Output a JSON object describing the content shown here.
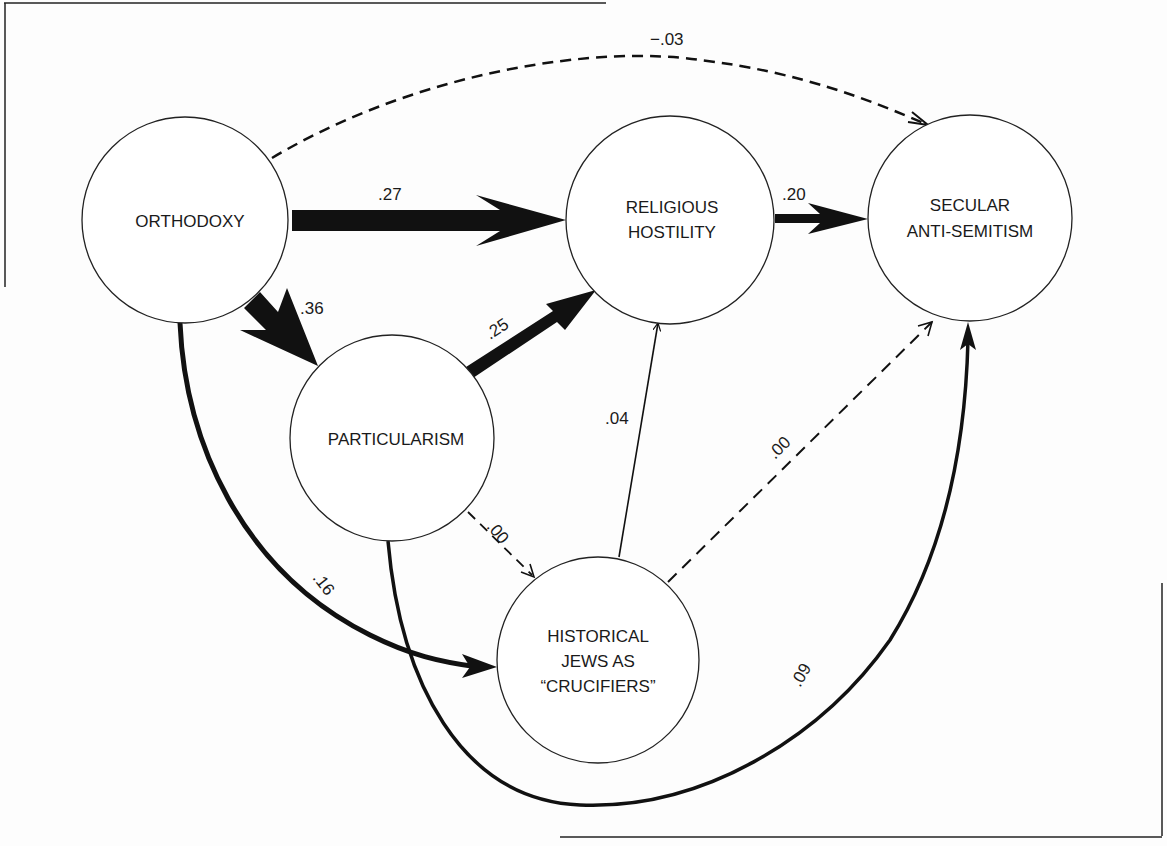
{
  "diagram": {
    "type": "path-model",
    "nodes": [
      {
        "id": "orthodoxy",
        "lines": [
          "ORTHODOXY"
        ]
      },
      {
        "id": "religious_hostility",
        "lines": [
          "RELIGIOUS",
          "HOSTILITY"
        ]
      },
      {
        "id": "secular_antisemitism",
        "lines": [
          "SECULAR",
          "ANTI-SEMITISM"
        ]
      },
      {
        "id": "particularism",
        "lines": [
          "PARTICULARISM"
        ]
      },
      {
        "id": "historical_jews",
        "lines": [
          "HISTORICAL",
          "JEWS AS",
          "“CRUCIFIERS”"
        ]
      }
    ],
    "edges": [
      {
        "from": "orthodoxy",
        "to": "secular_antisemitism",
        "label": "−.03",
        "style": "dashed"
      },
      {
        "from": "orthodoxy",
        "to": "religious_hostility",
        "label": ".27",
        "style": "thick"
      },
      {
        "from": "religious_hostility",
        "to": "secular_antisemitism",
        "label": ".20",
        "style": "medium"
      },
      {
        "from": "orthodoxy",
        "to": "particularism",
        "label": ".36",
        "style": "very-thick"
      },
      {
        "from": "particularism",
        "to": "religious_hostility",
        "label": ".25",
        "style": "thick"
      },
      {
        "from": "historical_jews",
        "to": "religious_hostility",
        "label": ".04",
        "style": "thin"
      },
      {
        "from": "historical_jews",
        "to": "secular_antisemitism",
        "label": ".00",
        "style": "dashed"
      },
      {
        "from": "particularism",
        "to": "historical_jews",
        "label": ".00",
        "style": "dashed"
      },
      {
        "from": "orthodoxy",
        "to": "historical_jews",
        "label": ".16",
        "style": "medium-curve"
      },
      {
        "from": "particularism",
        "to": "secular_antisemitism",
        "label": ".09",
        "style": "medium-curve"
      }
    ]
  }
}
